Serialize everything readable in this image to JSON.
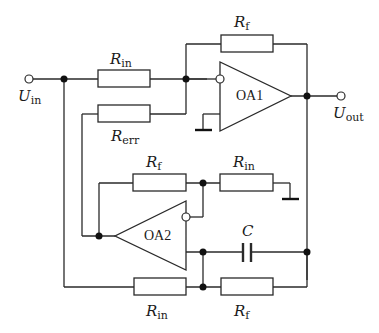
{
  "diagram": {
    "type": "circuit schematic",
    "title": "",
    "components": {
      "oa1": {
        "label": "OA1"
      },
      "oa2": {
        "label": "OA2"
      },
      "r_in_top": {
        "symbol": "R",
        "sub": "in"
      },
      "r_f_top": {
        "symbol": "R",
        "sub": "f"
      },
      "r_err": {
        "symbol": "R",
        "sub": "err"
      },
      "r_f_mid": {
        "symbol": "R",
        "sub": "f"
      },
      "r_in_mid": {
        "symbol": "R",
        "sub": "in"
      },
      "cap": {
        "symbol": "C",
        "sub": ""
      },
      "r_in_bot": {
        "symbol": "R",
        "sub": "in"
      },
      "r_f_bot": {
        "symbol": "R",
        "sub": "f"
      }
    },
    "terminals": {
      "input": {
        "symbol": "U",
        "sub": "in"
      },
      "output": {
        "symbol": "U",
        "sub": "out"
      }
    }
  }
}
